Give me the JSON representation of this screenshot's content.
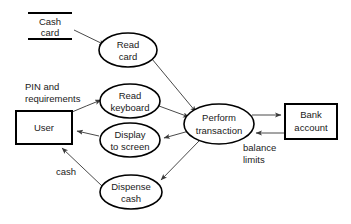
{
  "diagram": {
    "type": "data-flow-diagram",
    "colors": {
      "background": "#ffffff",
      "node_stroke": "#000000",
      "flow_stroke": "#4a4a4a",
      "text": "#1a1a1a"
    },
    "stores": [
      {
        "id": "cash-card",
        "line1": "Cash",
        "line2": "card",
        "x": 28,
        "y": 12,
        "width": 44,
        "height": 26
      }
    ],
    "entities": [
      {
        "id": "user",
        "label": "User",
        "x": 16,
        "y": 111,
        "width": 56,
        "height": 33
      },
      {
        "id": "bank-account",
        "label_line1": "Bank",
        "label_line2": "account",
        "x": 285,
        "y": 104,
        "width": 52,
        "height": 35
      }
    ],
    "processes": [
      {
        "id": "read-card",
        "line1": "Read",
        "line2": "card",
        "cx": 128,
        "cy": 50,
        "rx": 29,
        "ry": 17
      },
      {
        "id": "read-keyboard",
        "line1": "Read",
        "line2": "keyboard",
        "cx": 130,
        "cy": 101,
        "rx": 30,
        "ry": 17
      },
      {
        "id": "display-to-screen",
        "line1": "Display",
        "line2": "to screen",
        "cx": 130,
        "cy": 140,
        "rx": 30,
        "ry": 17
      },
      {
        "id": "dispense-cash",
        "line1": "Dispense",
        "line2": "cash",
        "cx": 131,
        "cy": 192,
        "rx": 31,
        "ry": 17
      },
      {
        "id": "perform-transaction",
        "line1": "Perform",
        "line2": "transaction",
        "cx": 219,
        "cy": 124,
        "rx": 35,
        "ry": 20
      }
    ],
    "flow_labels": [
      {
        "id": "pin-and-requirements",
        "line1": "PIN and",
        "line2": "requirements",
        "x": 25,
        "y": 86
      },
      {
        "id": "cash",
        "line1": "cash",
        "line2": "",
        "x": 56,
        "y": 172
      },
      {
        "id": "balance-limits",
        "line1": "balance",
        "line2": "limits",
        "x": 243,
        "y": 148
      }
    ],
    "flows": [
      {
        "id": "cash-card-to-read-card",
        "from": "cash-card",
        "to": "read-card"
      },
      {
        "id": "user-to-read-keyboard",
        "from": "user",
        "to": "read-keyboard",
        "label": "PIN and requirements"
      },
      {
        "id": "read-card-to-perform-transaction",
        "from": "read-card",
        "to": "perform-transaction"
      },
      {
        "id": "read-keyboard-to-perform-transaction",
        "from": "read-keyboard",
        "to": "perform-transaction"
      },
      {
        "id": "perform-transaction-to-display",
        "from": "perform-transaction",
        "to": "display-to-screen"
      },
      {
        "id": "perform-transaction-to-dispense-cash",
        "from": "perform-transaction",
        "to": "dispense-cash"
      },
      {
        "id": "display-to-user",
        "from": "display-to-screen",
        "to": "user"
      },
      {
        "id": "dispense-cash-to-user",
        "from": "dispense-cash",
        "to": "user",
        "label": "cash"
      },
      {
        "id": "perform-transaction-to-bank-account",
        "from": "perform-transaction",
        "to": "bank-account"
      },
      {
        "id": "bank-account-to-perform-transaction",
        "from": "bank-account",
        "to": "perform-transaction",
        "label": "balance limits"
      }
    ]
  }
}
